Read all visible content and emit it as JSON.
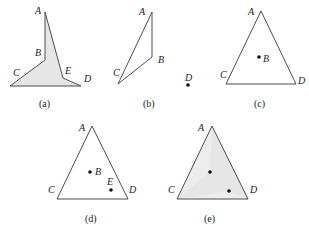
{
  "figure": {
    "panels": [
      {
        "id": "a",
        "caption": "(a)",
        "vertices": {
          "A": "A",
          "B": "B",
          "C": "C",
          "D": "D",
          "E": "E"
        },
        "description": "Shaded polygon C-B-A-E-D"
      },
      {
        "id": "b",
        "caption": "(b)",
        "vertices": {
          "A": "A",
          "B": "B",
          "C": "C",
          "D": "D"
        },
        "description": "Triangle A-B-C with separate point D"
      },
      {
        "id": "c",
        "caption": "(c)",
        "vertices": {
          "A": "A",
          "B": "B",
          "C": "C",
          "D": "D"
        },
        "description": "Triangle A-C-D with interior point B"
      },
      {
        "id": "d",
        "caption": "(d)",
        "vertices": {
          "A": "A",
          "B": "B",
          "C": "C",
          "D": "D",
          "E": "E"
        },
        "description": "Triangle A-C-D with interior points B and E"
      },
      {
        "id": "e",
        "caption": "(e)",
        "vertices": {
          "A": "A",
          "C": "C",
          "D": "D"
        },
        "description": "Shaded triangle A-C-D with two interior points"
      }
    ],
    "colors": {
      "shade": "#e6e6e6",
      "line": "#3a3a3a",
      "dot": "#111111"
    }
  }
}
